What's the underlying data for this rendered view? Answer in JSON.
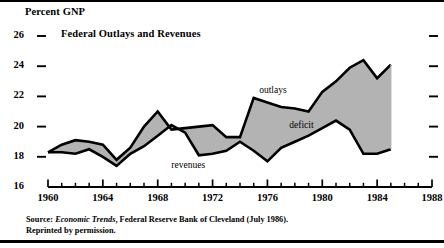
{
  "figure": {
    "axis_unit_label": "Percent GNP",
    "title": "Federal Outlays and Revenues",
    "source_line_1_prefix": "Source: ",
    "source_line_1_italic": "Economic Trends",
    "source_line_1_suffix": ", Federal Reserve Bank of Cleveland (July 1986).",
    "source_line_2": "Reprinted by permission."
  },
  "chart_data": {
    "type": "area",
    "title": "Federal Outlays and Revenues",
    "xlabel": "",
    "ylabel": "Percent GNP",
    "xlim": [
      1960,
      1988
    ],
    "ylim": [
      16,
      26
    ],
    "grid": false,
    "legend_position": "inline-annotations",
    "x_tick_labels": [
      "1960",
      "1964",
      "1968",
      "1972",
      "1976",
      "1980",
      "1984",
      "1988"
    ],
    "x_tick_values": [
      1960,
      1964,
      1968,
      1972,
      1976,
      1980,
      1984,
      1988
    ],
    "x_minor_ticks": [
      1961,
      1962,
      1963,
      1965,
      1966,
      1967,
      1969,
      1970,
      1971,
      1973,
      1974,
      1975,
      1977,
      1978,
      1979,
      1981,
      1982,
      1983,
      1985,
      1986,
      1987
    ],
    "y_tick_labels": [
      "26",
      "24",
      "22",
      "20",
      "18",
      "16"
    ],
    "y_tick_values": [
      26,
      24,
      22,
      20,
      18,
      16
    ],
    "y_right_tick_values": [
      26,
      24,
      22,
      20,
      18
    ],
    "fill_label": "deficit",
    "fill_color": "#b3b3b3",
    "line_color": "#000000",
    "annotations": [
      {
        "text": "outlays",
        "x": 1977.0,
        "y": 22.3
      },
      {
        "text": "deficit",
        "x": 1979.2,
        "y": 20.0
      },
      {
        "text": "revenues",
        "x": 1970.6,
        "y": 17.3
      }
    ],
    "x": [
      1960,
      1961,
      1962,
      1963,
      1964,
      1965,
      1966,
      1967,
      1968,
      1969,
      1970,
      1971,
      1972,
      1973,
      1974,
      1975,
      1976,
      1977,
      1978,
      1979,
      1980,
      1981,
      1982,
      1983,
      1984,
      1985
    ],
    "series": [
      {
        "name": "outlays",
        "values": [
          18.3,
          18.8,
          19.1,
          19.0,
          18.8,
          17.8,
          18.6,
          20.0,
          21.0,
          19.8,
          19.9,
          20.0,
          20.1,
          19.3,
          19.3,
          21.9,
          21.6,
          21.3,
          21.2,
          21.0,
          22.3,
          23.0,
          23.9,
          24.4,
          23.2,
          24.1
        ]
      },
      {
        "name": "revenues",
        "values": [
          18.3,
          18.3,
          18.2,
          18.5,
          18.0,
          17.4,
          18.2,
          18.7,
          19.4,
          20.1,
          19.6,
          18.1,
          18.2,
          18.4,
          19.0,
          18.4,
          17.7,
          18.6,
          19.0,
          19.4,
          19.9,
          20.4,
          19.8,
          18.2,
          18.2,
          18.5
        ]
      }
    ]
  }
}
